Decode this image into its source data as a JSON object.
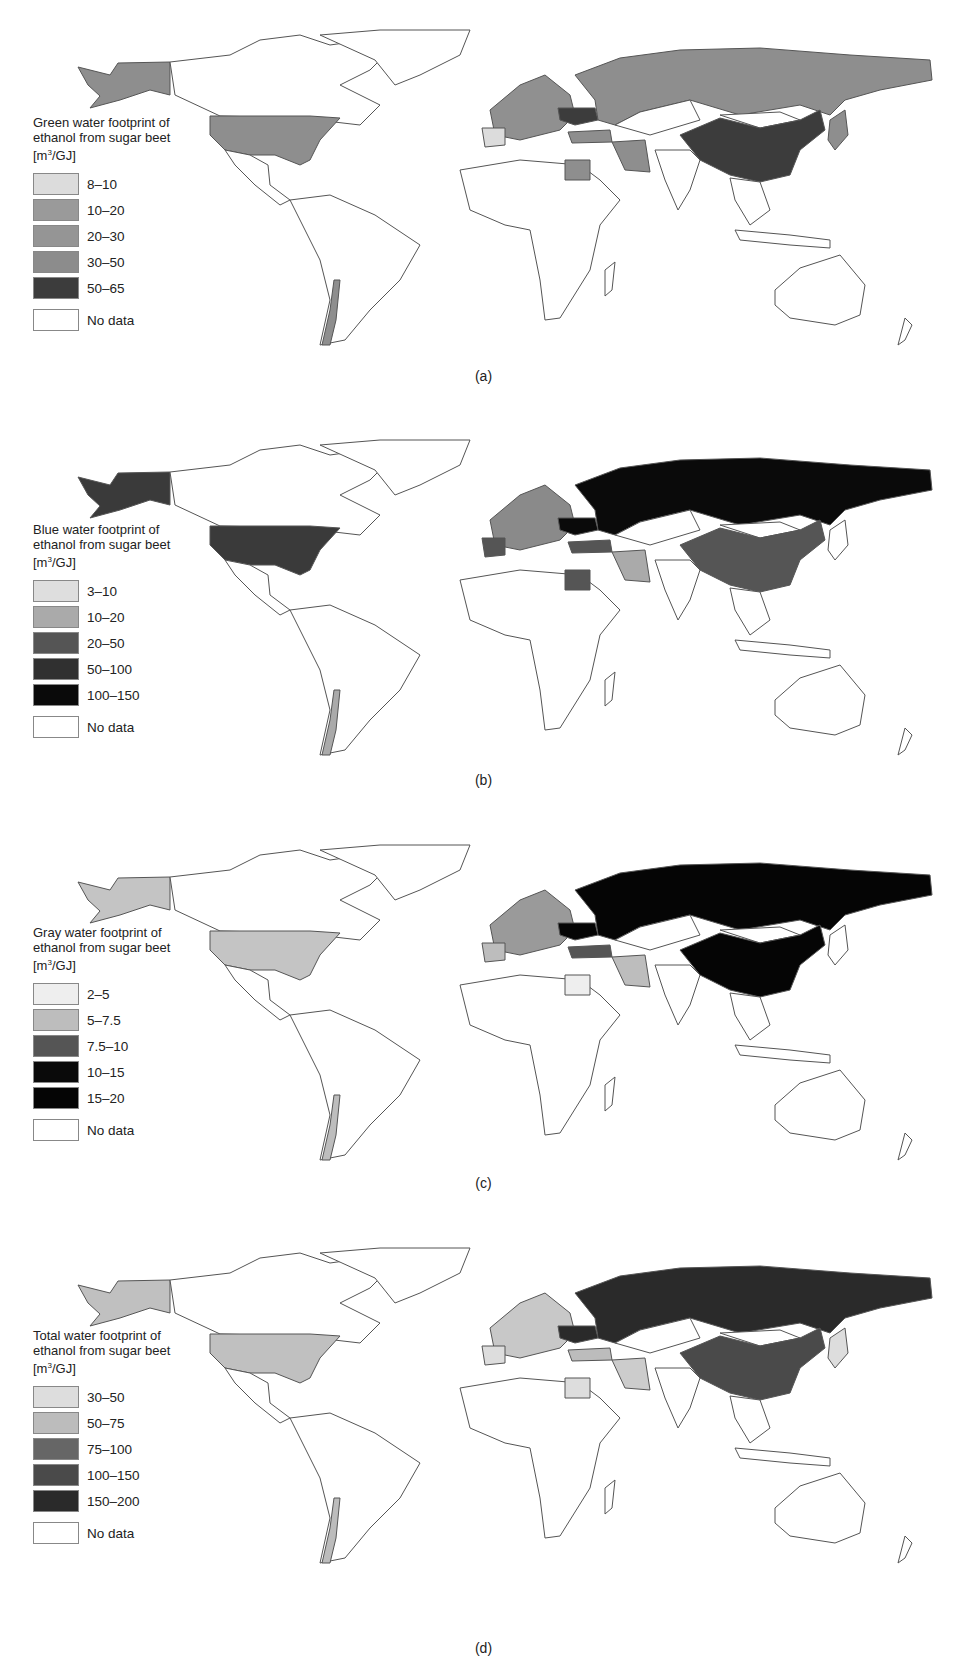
{
  "figure": {
    "panels": [
      {
        "id": "a",
        "caption": "(a)",
        "legend_title_line1": "Green water footprint of",
        "legend_title_line2": "ethanol from sugar beet",
        "unit_prefix": "[m",
        "unit_sup": "3",
        "unit_suffix": "/GJ]",
        "classes": [
          {
            "label": "8–10",
            "color": "#dcdcdc"
          },
          {
            "label": "10–20",
            "color": "#9a9a9a"
          },
          {
            "label": "20–30",
            "color": "#959595"
          },
          {
            "label": "30–50",
            "color": "#8c8c8c"
          },
          {
            "label": "50–65",
            "color": "#3c3c3c"
          },
          {
            "label": "No data",
            "color": "#ffffff"
          }
        ],
        "fills": {
          "usa": "#8e8e8e",
          "alaska": "#8e8e8e",
          "russia": "#8e8e8e",
          "china": "#3c3c3c",
          "europe": "#909090",
          "ukraine": "#3c3c3c",
          "spain": "#dcdcdc",
          "iran": "#8e8e8e",
          "egypt": "#8e8e8e",
          "chile": "#8e8e8e",
          "japan": "#8e8e8e",
          "turkey": "#8e8e8e"
        }
      },
      {
        "id": "b",
        "caption": "(b)",
        "legend_title_line1": "Blue water footprint of",
        "legend_title_line2": "ethanol from sugar beet",
        "unit_prefix": "[m",
        "unit_sup": "3",
        "unit_suffix": "/GJ]",
        "classes": [
          {
            "label": "3–10",
            "color": "#dedede"
          },
          {
            "label": "10–20",
            "color": "#aaaaaa"
          },
          {
            "label": "20–50",
            "color": "#555555"
          },
          {
            "label": "50–100",
            "color": "#303030"
          },
          {
            "label": "100–150",
            "color": "#0a0a0a"
          },
          {
            "label": "No data",
            "color": "#ffffff"
          }
        ],
        "fills": {
          "usa": "#3a3a3a",
          "alaska": "#3a3a3a",
          "russia": "#0a0a0a",
          "china": "#555555",
          "europe": "#8a8a8a",
          "ukraine": "#0a0a0a",
          "spain": "#555555",
          "iran": "#aaaaaa",
          "egypt": "#555555",
          "chile": "#aaaaaa",
          "japan": "#ffffff",
          "turkey": "#555555"
        }
      },
      {
        "id": "c",
        "caption": "(c)",
        "legend_title_line1": "Gray water footprint of",
        "legend_title_line2": "ethanol from sugar beet",
        "unit_prefix": "[m",
        "unit_sup": "3",
        "unit_suffix": "/GJ]",
        "classes": [
          {
            "label": "2–5",
            "color": "#eeeeee"
          },
          {
            "label": "5–7.5",
            "color": "#bdbdbd"
          },
          {
            "label": "7.5–10",
            "color": "#555555"
          },
          {
            "label": "10–15",
            "color": "#0a0a0a"
          },
          {
            "label": "15–20",
            "color": "#050505"
          },
          {
            "label": "No data",
            "color": "#ffffff"
          }
        ],
        "fills": {
          "usa": "#c4c4c4",
          "alaska": "#c4c4c4",
          "russia": "#050505",
          "china": "#050505",
          "europe": "#9a9a9a",
          "ukraine": "#050505",
          "spain": "#bdbdbd",
          "iran": "#bdbdbd",
          "egypt": "#eeeeee",
          "chile": "#bdbdbd",
          "japan": "#ffffff",
          "turkey": "#555555"
        }
      },
      {
        "id": "d",
        "caption": "(d)",
        "legend_title_line1": "Total water footprint of",
        "legend_title_line2": "ethanol from sugar beet",
        "unit_prefix": "[m",
        "unit_sup": "3",
        "unit_suffix": "/GJ]",
        "classes": [
          {
            "label": "30–50",
            "color": "#dddddd"
          },
          {
            "label": "50–75",
            "color": "#bcbcbc"
          },
          {
            "label": "75–100",
            "color": "#666666"
          },
          {
            "label": "100–150",
            "color": "#4a4a4a"
          },
          {
            "label": "150–200",
            "color": "#2a2a2a"
          },
          {
            "label": "No data",
            "color": "#ffffff"
          }
        ],
        "fills": {
          "usa": "#c0c0c0",
          "alaska": "#c0c0c0",
          "russia": "#2a2a2a",
          "china": "#4a4a4a",
          "europe": "#c8c8c8",
          "ukraine": "#2a2a2a",
          "spain": "#dddddd",
          "iran": "#cccccc",
          "egypt": "#dddddd",
          "chile": "#bcbcbc",
          "japan": "#dddddd",
          "turkey": "#bcbcbc"
        }
      }
    ]
  },
  "chart_data": [
    {
      "type": "choropleth",
      "title": "Green water footprint of ethanol from sugar beet",
      "unit": "m3/GJ",
      "classes": [
        "8–10",
        "10–20",
        "20–30",
        "30–50",
        "50–65",
        "No data"
      ],
      "regions": {
        "United States": "30–50",
        "Russia": "30–50",
        "China": "50–65",
        "Ukraine": "50–65",
        "Spain": "8–10",
        "Egypt": "30–50",
        "Iran": "30–50",
        "Chile": "30–50",
        "Japan": "30–50"
      }
    },
    {
      "type": "choropleth",
      "title": "Blue water footprint of ethanol from sugar beet",
      "unit": "m3/GJ",
      "classes": [
        "3–10",
        "10–20",
        "20–50",
        "50–100",
        "100–150",
        "No data"
      ],
      "regions": {
        "United States": "50–100",
        "Russia": "100–150",
        "China": "20–50",
        "Ukraine": "100–150",
        "Spain": "20–50",
        "Egypt": "20–50",
        "Iran": "10–20",
        "Chile": "10–20",
        "Turkey": "20–50"
      }
    },
    {
      "type": "choropleth",
      "title": "Gray water footprint of ethanol from sugar beet",
      "unit": "m3/GJ",
      "classes": [
        "2–5",
        "5–7.5",
        "7.5–10",
        "10–15",
        "15–20",
        "No data"
      ],
      "regions": {
        "United States": "5–7.5",
        "Russia": "15–20",
        "China": "15–20",
        "Ukraine": "15–20",
        "Spain": "5–7.5",
        "Egypt": "2–5",
        "Iran": "5–7.5",
        "Chile": "5–7.5",
        "Turkey": "7.5–10"
      }
    },
    {
      "type": "choropleth",
      "title": "Total water footprint of ethanol from sugar beet",
      "unit": "m3/GJ",
      "classes": [
        "30–50",
        "50–75",
        "75–100",
        "100–150",
        "150–200",
        "No data"
      ],
      "regions": {
        "United States": "50–75",
        "Russia": "150–200",
        "China": "100–150",
        "Ukraine": "150–200",
        "Spain": "30–50",
        "Egypt": "30–50",
        "Iran": "30–50",
        "Chile": "50–75",
        "Turkey": "50–75"
      }
    }
  ]
}
